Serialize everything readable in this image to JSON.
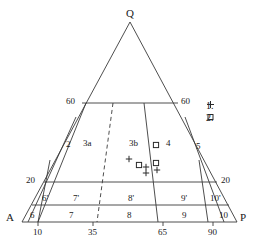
{
  "diagram": {
    "type": "ternary-qap-classification",
    "apices": [
      {
        "name": "Q",
        "label": "Q",
        "x": 130,
        "y": 14
      },
      {
        "name": "A",
        "label": "A",
        "x": 8,
        "y": 218
      },
      {
        "name": "P",
        "label": "P",
        "x": 241,
        "y": 218
      }
    ],
    "side_labels": [
      {
        "name": "left-60",
        "label": "60",
        "x": 68,
        "y": 98
      },
      {
        "name": "right-60",
        "label": "60",
        "x": 180,
        "y": 98
      },
      {
        "name": "left-20",
        "label": "20",
        "x": 27,
        "y": 177
      },
      {
        "name": "right-20",
        "label": "20",
        "x": 220,
        "y": 177
      }
    ],
    "base_ticks": [
      {
        "label": "10",
        "x": 38,
        "y": 231
      },
      {
        "label": "35",
        "x": 88,
        "y": 231
      },
      {
        "label": "65",
        "x": 158,
        "y": 231
      },
      {
        "label": "90",
        "x": 208,
        "y": 231
      }
    ],
    "fields": [
      {
        "name": "field-2",
        "label": "2",
        "x": 66,
        "y": 145
      },
      {
        "name": "field-3a",
        "label": "3a",
        "x": 85,
        "y": 144
      },
      {
        "name": "field-3b",
        "label": "3b",
        "x": 131,
        "y": 144
      },
      {
        "name": "field-4",
        "label": "4",
        "x": 165,
        "y": 144
      },
      {
        "name": "field-5",
        "label": "5",
        "x": 196,
        "y": 145
      },
      {
        "name": "field-6p",
        "label": "6'",
        "x": 44,
        "y": 198
      },
      {
        "name": "field-7p",
        "label": "7'",
        "x": 74,
        "y": 198
      },
      {
        "name": "field-8p",
        "label": "8'",
        "x": 130,
        "y": 198
      },
      {
        "name": "field-9p",
        "label": "9'",
        "x": 180,
        "y": 198
      },
      {
        "name": "field-10p",
        "label": "10'",
        "x": 212,
        "y": 198
      },
      {
        "name": "field-6",
        "label": "6",
        "x": 31,
        "y": 216
      },
      {
        "name": "field-7",
        "label": "7",
        "x": 70,
        "y": 216
      },
      {
        "name": "field-8",
        "label": "8",
        "x": 128,
        "y": 216
      },
      {
        "name": "field-9",
        "label": "9",
        "x": 182,
        "y": 216
      },
      {
        "name": "field-10",
        "label": "10",
        "x": 221,
        "y": 216
      }
    ],
    "legend": [
      {
        "name": "legend-item-1",
        "label": "1.",
        "marker": "plus-marker",
        "x": 206,
        "y": 105
      },
      {
        "name": "legend-item-2",
        "label": "2.",
        "marker": "square-marker",
        "x": 206,
        "y": 117
      }
    ],
    "data_points": [
      {
        "marker": "plus-marker",
        "x": 129,
        "y": 159
      },
      {
        "marker": "square-marker",
        "x": 139,
        "y": 165
      },
      {
        "marker": "plus-marker",
        "x": 146,
        "y": 167
      },
      {
        "marker": "square-marker",
        "x": 156,
        "y": 163
      },
      {
        "marker": "square-marker",
        "x": 156,
        "y": 145
      },
      {
        "marker": "plus-marker",
        "x": 146,
        "y": 173
      },
      {
        "marker": "plus-marker",
        "x": 157,
        "y": 170
      }
    ],
    "colors": {
      "line": "#3a3a3a",
      "text": "#1a1a1a",
      "background": "#ffffff"
    }
  }
}
